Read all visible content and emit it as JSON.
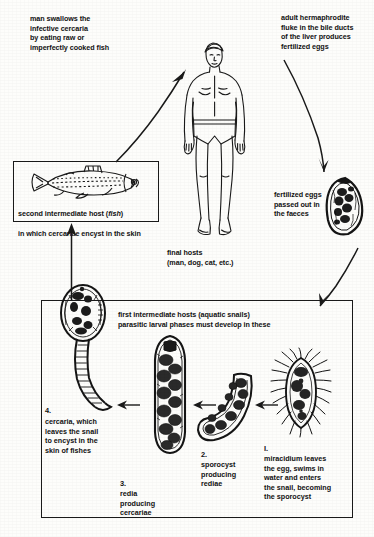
{
  "diagram": {
    "ink_color": "#111111",
    "background_color": "#fdfdfb"
  },
  "captions": {
    "man_swallows": "man swallows the\ninfective cercaria\nby eating raw or\nimperfectly cooked fish",
    "adult_fluke": "adult hermaphrodite\nfluke in the bile ducts\nof the liver produces\nfertilized eggs",
    "fertilized_eggs": "fertilized eggs\npassed out in\nthe faeces",
    "final_hosts": "final hosts\n(man, dog, cat, etc.)",
    "fish_box_line1_a": "second intermediate host (",
    "fish_box_line1_italic": "fish",
    "fish_box_line1_b": ")",
    "fish_box_line2": "in which cercariae encyst in the skin",
    "snail_box_header": "first intermediate hosts (aquatic snails)\nparasitic larval phases must develop in these"
  },
  "stages": [
    {
      "number": "I.",
      "name": "miracidium",
      "text": "miracidium leaves\nthe egg, swims in\nwater and enters\nthe snail, becoming\nthe sporocyst"
    },
    {
      "number": "2.",
      "name": "sporocyst",
      "text": "sporocyst\nproducing\nrediae"
    },
    {
      "number": "3.",
      "name": "redia",
      "text": "redia\nproducing\ncercariae"
    },
    {
      "number": "4.",
      "name": "cercaria",
      "text": "cercaria, which\nleaves the snail\nto encyst in the\nskin of fishes"
    }
  ],
  "figures": {
    "human": "human-figure-final-host",
    "fish": "fish-second-intermediate-host",
    "egg": "fertilized-egg",
    "miracidium": "miracidium",
    "sporocyst": "sporocyst",
    "redia": "redia",
    "cercaria": "cercaria"
  }
}
